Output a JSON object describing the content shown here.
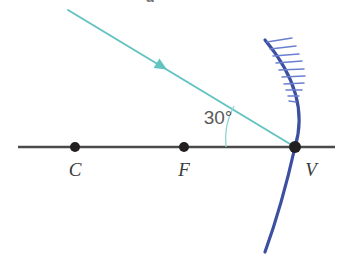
{
  "figure": {
    "kind": "optics-ray-diagram",
    "title_fragment": "g",
    "background_color": "#ffffff"
  },
  "axis": {
    "name": "principal-axis",
    "color": "#4a4a4a",
    "x_start": 18,
    "x_end": 335,
    "y": 147,
    "stroke_width": 2.6
  },
  "points": [
    {
      "id": "center-of-curvature",
      "label": "C",
      "x": 75,
      "y": 147,
      "label_x": 75,
      "label_y": 176,
      "dot_radius": 5,
      "dot_color": "#231f20"
    },
    {
      "id": "focal-point",
      "label": "F",
      "x": 184,
      "y": 147,
      "label_x": 184,
      "label_y": 176,
      "dot_radius": 5,
      "dot_color": "#231f20"
    },
    {
      "id": "vertex",
      "label": "V",
      "x": 295,
      "y": 147,
      "label_x": 311,
      "label_y": 176,
      "dot_radius": 6,
      "dot_color": "#231f20"
    }
  ],
  "mirror": {
    "name": "concave-mirror",
    "color": "#3c4fa0",
    "stroke_width": 3.2,
    "path": "M 265 40 Q 311 95 295 147 Q 282 205 265 252",
    "opens_toward": "left",
    "hatching": {
      "color": "#6b7fd0",
      "stroke_width": 1.5,
      "count": 10,
      "marks": [
        [
          267,
          42,
          292,
          38
        ],
        [
          270,
          49,
          296,
          46
        ],
        [
          273,
          56,
          299,
          54
        ],
        [
          276,
          63,
          302,
          61
        ],
        [
          279,
          70,
          304,
          69
        ],
        [
          282,
          77,
          305,
          76
        ],
        [
          284,
          84,
          304,
          83
        ],
        [
          286,
          90,
          302,
          90
        ],
        [
          288,
          96,
          299,
          96
        ],
        [
          289,
          101,
          296,
          102
        ]
      ]
    }
  },
  "incident_ray": {
    "name": "incident-ray",
    "color": "#62c3c0",
    "stroke_width": 2.0,
    "x1": 68,
    "y1": 10,
    "x2": 295,
    "y2": 147,
    "arrow": {
      "x": 161,
      "y": 66,
      "size": 7
    }
  },
  "angle": {
    "name": "angle-of-incidence",
    "value_label": "30°",
    "degrees": 30,
    "label_x": 218,
    "label_y": 124,
    "arc_color": "#8fd3d0",
    "arc_stroke_width": 1.3,
    "arc_path": "M 226 147 A 70 70 0 0 1 234 106"
  }
}
